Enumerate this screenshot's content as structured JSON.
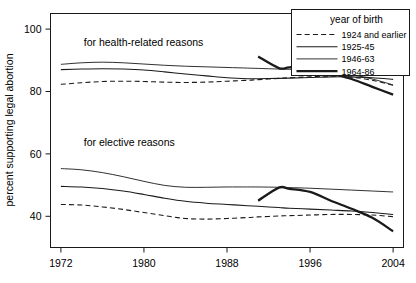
{
  "chart_data": {
    "type": "line",
    "title": "",
    "xlabel": "",
    "ylabel": "percent supporting legal abortion",
    "xlim": [
      1971,
      2005
    ],
    "ylim": [
      30,
      105
    ],
    "xticks": [
      1972,
      1980,
      1988,
      1996,
      2004
    ],
    "yticks": [
      40,
      60,
      80,
      100
    ],
    "xtick_labels": [
      "1972",
      "1980",
      "1988",
      "1996",
      "2004"
    ],
    "ytick_labels": [
      "40",
      "60",
      "80",
      "100"
    ],
    "grid": false,
    "legend_position": "top-right",
    "legend_title": "year of birth",
    "annotations": [
      {
        "text": "for health-related reasons",
        "x": 1974.2,
        "y": 94.5
      },
      {
        "text": "for elective reasons",
        "x": 1974.2,
        "y": 62.5
      }
    ],
    "groups": [
      {
        "name": "for health-related reasons",
        "series": [
          {
            "name": "1924 and earlier",
            "style": "dashed",
            "x": [
              1972,
              1974,
              1976,
              1978,
              1980,
              1982,
              1984,
              1986,
              1988,
              1990,
              1991,
              1993,
              1994,
              1996,
              1998,
              2000,
              2002,
              2004
            ],
            "values": [
              82.3,
              82.8,
              83.2,
              83.3,
              83.2,
              83.0,
              82.9,
              83.0,
              83.3,
              83.6,
              83.8,
              84.2,
              84.4,
              84.7,
              84.9,
              84.6,
              83.6,
              82.0
            ]
          },
          {
            "name": "1925-45",
            "style": "medium",
            "x": [
              1972,
              1974,
              1976,
              1978,
              1980,
              1982,
              1984,
              1986,
              1988,
              1990,
              1991,
              1993,
              1994,
              1996,
              1998,
              2000,
              2002,
              2004
            ],
            "values": [
              87.0,
              87.2,
              87.3,
              87.2,
              86.9,
              86.3,
              85.6,
              85.0,
              84.4,
              84.1,
              84.1,
              84.2,
              84.3,
              84.5,
              84.7,
              84.7,
              84.4,
              83.9
            ]
          },
          {
            "name": "1946-63",
            "style": "thin",
            "x": [
              1972,
              1974,
              1976,
              1978,
              1980,
              1982,
              1984,
              1986,
              1988,
              1990,
              1991,
              1993,
              1994,
              1996,
              1998,
              2000,
              2002,
              2004
            ],
            "values": [
              88.7,
              89.2,
              89.4,
              89.2,
              88.8,
              88.4,
              88.1,
              87.9,
              87.7,
              87.5,
              87.4,
              87.2,
              87.1,
              86.8,
              86.3,
              85.4,
              84.0,
              82.1
            ]
          },
          {
            "name": "1964-86",
            "style": "thick",
            "x": [
              1991,
              1993,
              1994,
              1996,
              1998,
              2000,
              2002,
              2004
            ],
            "values": [
              91.2,
              87.5,
              87.7,
              88.0,
              86.0,
              84.0,
              81.5,
              79.0
            ]
          }
        ]
      },
      {
        "name": "for elective reasons",
        "series": [
          {
            "name": "1924 and earlier",
            "style": "dashed",
            "x": [
              1972,
              1974,
              1976,
              1978,
              1980,
              1982,
              1984,
              1986,
              1988,
              1990,
              1991,
              1993,
              1994,
              1996,
              1998,
              2000,
              2002,
              2004
            ],
            "values": [
              43.8,
              43.6,
              43.0,
              42.2,
              41.2,
              40.2,
              39.3,
              39.1,
              39.3,
              39.6,
              39.8,
              40.1,
              40.2,
              40.4,
              40.6,
              40.6,
              40.4,
              39.9
            ]
          },
          {
            "name": "1925-45",
            "style": "medium",
            "x": [
              1972,
              1974,
              1976,
              1978,
              1980,
              1982,
              1984,
              1986,
              1988,
              1990,
              1991,
              1993,
              1994,
              1996,
              1998,
              2000,
              2002,
              2004
            ],
            "values": [
              49.6,
              49.4,
              48.9,
              48.1,
              47.0,
              45.8,
              44.8,
              44.2,
              43.8,
              43.4,
              43.2,
              42.8,
              42.6,
              42.3,
              42.0,
              41.7,
              41.2,
              40.6
            ]
          },
          {
            "name": "1946-63",
            "style": "thin",
            "x": [
              1972,
              1974,
              1976,
              1978,
              1980,
              1982,
              1984,
              1986,
              1988,
              1990,
              1991,
              1993,
              1994,
              1996,
              1998,
              2000,
              2002,
              2004
            ],
            "values": [
              55.3,
              54.9,
              54.0,
              52.7,
              51.2,
              49.9,
              49.3,
              49.3,
              49.4,
              49.4,
              49.4,
              49.3,
              49.2,
              49.0,
              48.7,
              48.4,
              48.1,
              47.8
            ]
          },
          {
            "name": "1964-86",
            "style": "thick",
            "x": [
              1991,
              1993,
              1994,
              1996,
              1998,
              2000,
              2002,
              2004
            ],
            "values": [
              45.0,
              49.2,
              48.8,
              47.8,
              45.0,
              42.4,
              39.5,
              35.2
            ]
          }
        ]
      }
    ],
    "legend_entries": [
      {
        "label": "1924 and earlier",
        "style": "dashed"
      },
      {
        "label": "1925-45",
        "style": "medium"
      },
      {
        "label": "1946-63",
        "style": "thin"
      },
      {
        "label": "1964-86",
        "style": "thick"
      }
    ]
  },
  "colors": {
    "line": "#1a1a1a",
    "background": "#ffffff"
  }
}
